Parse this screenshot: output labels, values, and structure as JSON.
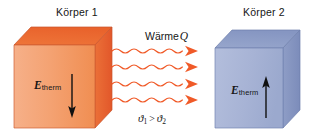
{
  "diagram": {
    "title_left": "Körper 1",
    "title_right": "Körper 2",
    "heat_label_text": "Wärme",
    "heat_label_symbol": "Q",
    "temperature_relation": {
      "left_symbol": "ϑ",
      "left_subscript": "1",
      "operator": ">",
      "right_symbol": "ϑ",
      "right_subscript": "2"
    },
    "energy_left": {
      "symbol": "E",
      "subscript": "therm",
      "arrow_direction": "down"
    },
    "energy_right": {
      "symbol": "E",
      "subscript": "therm",
      "arrow_direction": "up"
    },
    "wave_arrow_count": 4,
    "colors": {
      "cube_left_front": "#F2A070",
      "cube_left_top": "#EC6B35",
      "cube_left_side": "#E8643A",
      "cube_left_edge": "#C8502A",
      "cube_right_front": "#A8B4D6",
      "cube_right_top": "#8C9CC6",
      "cube_right_side": "#7E8FBE",
      "cube_right_edge": "#6A7BA8",
      "wave_arrow": "#F05A28",
      "energy_arrow": "#101010",
      "text": "#161616",
      "background": "#FFFFFF"
    }
  }
}
